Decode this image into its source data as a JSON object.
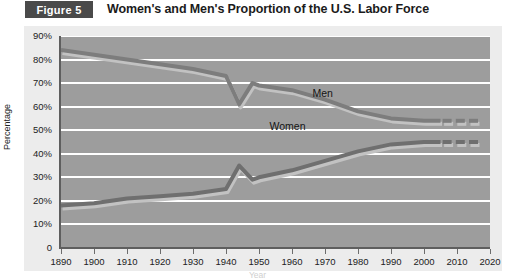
{
  "figure": {
    "badge": "Figure 5",
    "title": "Women's and Men's Proportion of the U.S. Labor Force"
  },
  "chart_data": {
    "type": "line",
    "title": "Women's and Men's Proportion of the U.S. Labor Force",
    "xlabel": "Year",
    "ylabel": "Percentage",
    "xlim": [
      1890,
      2020
    ],
    "ylim": [
      0,
      90
    ],
    "grid": true,
    "legend": "inline-annotation",
    "xticks": [
      "1890",
      "1900",
      "1910",
      "1920",
      "1930",
      "1940",
      "1950",
      "1960",
      "1970",
      "1980",
      "1990",
      "2000",
      "2010",
      "2020"
    ],
    "yticks": [
      "0",
      "10%",
      "20%",
      "30%",
      "40%",
      "50%",
      "60%",
      "70%",
      "80%",
      "90%"
    ],
    "x": [
      1890,
      1900,
      1910,
      1920,
      1930,
      1940,
      1944,
      1948,
      1950,
      1960,
      1970,
      1980,
      1990,
      2000,
      2005
    ],
    "series": [
      {
        "name": "Men",
        "label": "Men",
        "color": "#7d7d7d",
        "values": [
          84,
          82,
          80,
          78,
          76,
          73,
          61,
          70,
          69,
          67,
          63,
          58,
          55,
          54,
          54
        ],
        "projected": {
          "note": "dashed segment beyond 2005",
          "x": [
            2007,
            2011,
            2015
          ],
          "value": 54
        }
      },
      {
        "name": "Women",
        "label": "Women",
        "color": "#6f6f6f",
        "values": [
          18,
          19,
          21,
          22,
          23,
          25,
          35,
          29,
          30,
          33,
          37,
          41,
          44,
          45,
          45
        ],
        "projected": {
          "note": "dashed segment beyond 2005",
          "x": [
            2007,
            2011,
            2015
          ],
          "value": 45
        }
      }
    ]
  },
  "colors": {
    "badge_bg": "#4a4a4a",
    "panel_bg": "#ececec",
    "plot_bg": "#9d9d9d",
    "gridline": "#ffffff",
    "axis": "#5e5e5e",
    "men_line": "#7d7d7d",
    "women_line": "#6f6f6f"
  }
}
